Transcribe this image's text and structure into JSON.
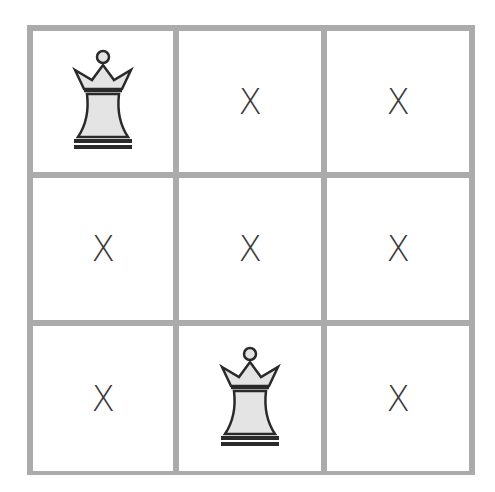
{
  "board": {
    "size": 3,
    "colors": {
      "grid_line": "#ababab",
      "cell_bg": "#ffffff",
      "mark": "#3a3a3a",
      "queen_fill": "#e4e4e4",
      "queen_stroke": "#2a2a2a"
    },
    "cells": [
      [
        {
          "type": "queen",
          "icon": "queen-icon"
        },
        {
          "type": "mark",
          "text": "X"
        },
        {
          "type": "mark",
          "text": "X"
        }
      ],
      [
        {
          "type": "mark",
          "text": "X"
        },
        {
          "type": "mark",
          "text": "X"
        },
        {
          "type": "mark",
          "text": "X"
        }
      ],
      [
        {
          "type": "mark",
          "text": "X"
        },
        {
          "type": "queen",
          "icon": "queen-icon"
        },
        {
          "type": "mark",
          "text": "X"
        }
      ]
    ]
  }
}
